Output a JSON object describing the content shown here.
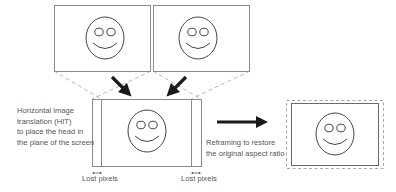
{
  "diagram": {
    "labels": {
      "hit_description": [
        "Horizontal image",
        "translation (HIT)",
        "to place the head in",
        "the plane of the screen"
      ],
      "lost_pixels_left": "Lost pixels",
      "lost_pixels_right": "Lost pixels",
      "reframing_description": [
        "Reframing to restore",
        "the original aspect ratio"
      ]
    },
    "nodes": [
      {
        "id": "left-view",
        "kind": "image-frame",
        "content": "smiley-face"
      },
      {
        "id": "right-view",
        "kind": "image-frame",
        "content": "smiley-face"
      },
      {
        "id": "hit-result",
        "kind": "image-frame",
        "content": "smiley-face",
        "cropped_edges": [
          "left",
          "right"
        ]
      },
      {
        "id": "reframed-result",
        "kind": "image-frame",
        "content": "smiley-face",
        "outer_border": "dashed"
      }
    ],
    "edges": [
      {
        "from": "left-view",
        "to": "hit-result",
        "style": "bold-arrow"
      },
      {
        "from": "right-view",
        "to": "hit-result",
        "style": "bold-arrow"
      },
      {
        "from": "hit-result",
        "to": "reframed-result",
        "style": "bold-arrow"
      }
    ],
    "colors": {
      "frame": "#8a8a8a",
      "dashed": "#b5b5b5",
      "arrow": "#1a1a1a",
      "face": "#444444",
      "text": "#555555"
    }
  }
}
